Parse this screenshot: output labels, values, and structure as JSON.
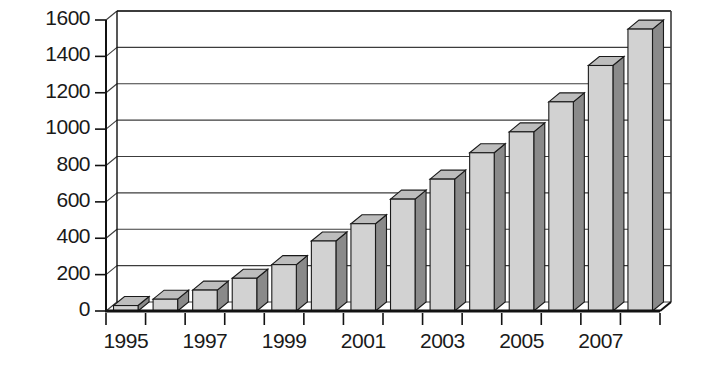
{
  "chart_data": {
    "type": "bar",
    "title": "",
    "subtitle": "",
    "xlabel": "",
    "ylabel": "",
    "categories": [
      "1995",
      "1996",
      "1997",
      "1998",
      "1999",
      "2000",
      "2001",
      "2002",
      "2003",
      "2004",
      "2005",
      "2006",
      "2007",
      "2008"
    ],
    "values": [
      30,
      65,
      115,
      180,
      255,
      385,
      480,
      615,
      725,
      870,
      985,
      1150,
      1350,
      1550
    ],
    "series": [
      {
        "name": "",
        "values": [
          30,
          65,
          115,
          180,
          255,
          385,
          480,
          615,
          725,
          870,
          985,
          1150,
          1350,
          1550
        ]
      }
    ],
    "ylim": [
      0,
      1600
    ],
    "yticks": [
      0,
      200,
      400,
      600,
      800,
      1000,
      1200,
      1400,
      1600
    ],
    "ytick_labels": [
      "0",
      "200",
      "400",
      "600",
      "800",
      "1000",
      "1200",
      "1400",
      "1600"
    ],
    "xtick_labels": [
      "1995",
      "",
      "1997",
      "",
      "1999",
      "",
      "2001",
      "",
      "2003",
      "",
      "2005",
      "",
      "2007",
      ""
    ],
    "visible_xtick_labels": [
      "1995",
      "1997",
      "1999",
      "2001",
      "2003",
      "2005",
      "2007"
    ],
    "grid": true,
    "grid_axis": "y",
    "legend": null,
    "legend_position": "none",
    "style": "3d-extruded-bar",
    "colors": {
      "bar_face": "#d2d2d2",
      "bar_side": "#8a8a8a",
      "bar_top": "#bdbdbd",
      "bar_outline": "#1a1a1a",
      "grid": "#3c3c3c",
      "axis": "#111111",
      "background": "#ffffff",
      "text": "#1a1a1a"
    }
  },
  "axes": {
    "y_axis_name": "y-axis",
    "x_axis_name": "x-axis"
  }
}
